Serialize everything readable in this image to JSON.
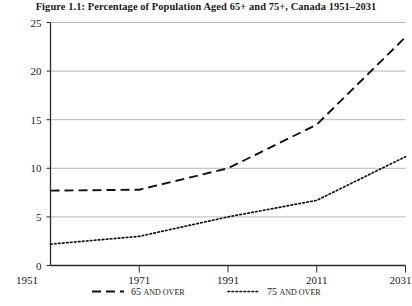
{
  "chart_data": {
    "type": "line",
    "title": "Figure 1.1: Percentage of Population Aged 65+ and 75+, Canada 1951–2031",
    "xlabel": "",
    "ylabel": "",
    "x": [
      1951,
      1971,
      1991,
      2011,
      2031
    ],
    "xticklabels": [
      "1951",
      "1971",
      "1991",
      "2011",
      "2031"
    ],
    "yticklabels": [
      "0",
      "5",
      "10",
      "15",
      "20",
      "25"
    ],
    "yticks": [
      0,
      5,
      10,
      15,
      20,
      25
    ],
    "xlim": [
      1951,
      2031
    ],
    "ylim": [
      0,
      25
    ],
    "grid": "horizontal",
    "legend_position": "bottom",
    "series": [
      {
        "name": "65 and over",
        "legend_main": "65",
        "legend_smallcaps": "and over",
        "style": "dashed",
        "values": [
          7.7,
          7.8,
          10.0,
          14.5,
          23.5
        ]
      },
      {
        "name": "75 and over",
        "legend_main": "75",
        "legend_smallcaps": "and over",
        "style": "dotted",
        "values": [
          2.2,
          3.0,
          5.0,
          6.7,
          11.2
        ]
      }
    ]
  },
  "colors": {
    "line": "#111111",
    "gridline": "#9a9a9a",
    "axis": "#2b2b2b",
    "background": "#ffffff",
    "text": "#1a1a1a"
  }
}
